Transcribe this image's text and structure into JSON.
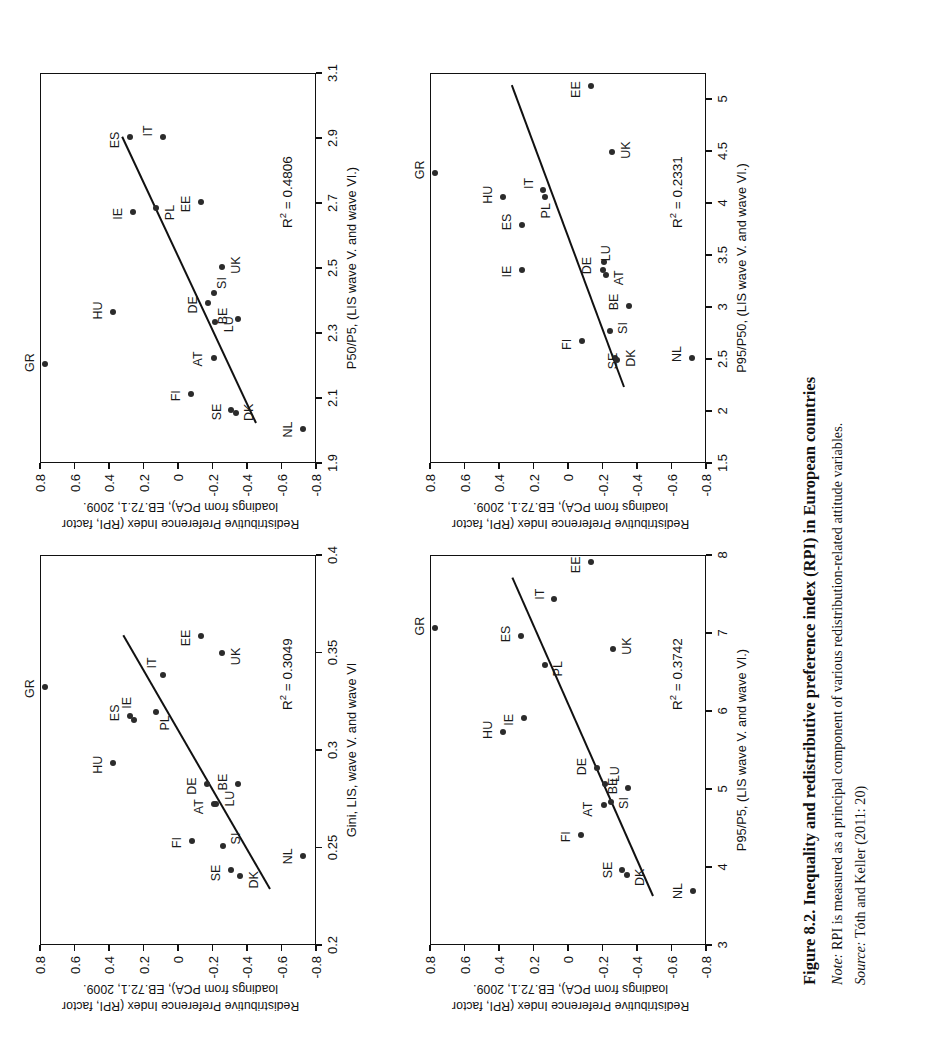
{
  "figure": {
    "number": "Figure 8.2.",
    "title": "Inequality and redistributive preference index (RPI) in European countries",
    "note_label": "Note:",
    "note_text": "RPI is measured as a principal component of various redistribution-related attitude variables.",
    "source_label": "Source:",
    "source_text": "Tóth and Keller (2011: 20)"
  },
  "shared": {
    "ylabel": "Redistributive Preference Index (RPI, factor loadings from PCA),  EB.72.1, 2009.",
    "ylabel_line1": "Redistributive Preference Index (RPI, factor",
    "ylabel_line2": "loadings from PCA),  EB.72.1, 2009.",
    "yticks": [
      "0.8",
      "0.6",
      "0.4",
      "0.2",
      "0",
      "-0.2",
      "-0.4",
      "-0.6",
      "-0.8"
    ],
    "yvalues": [
      0.8,
      0.6,
      0.4,
      0.2,
      0,
      -0.2,
      -0.4,
      -0.6,
      -0.8
    ],
    "ylim": [
      -0.8,
      0.8
    ]
  },
  "chart_data": [
    {
      "id": "gini",
      "type": "scatter",
      "position": "top-left",
      "title": "",
      "xlabel": "Gini, LIS, wave  V. and wave VI",
      "ylabel": "Redistributive Preference Index (RPI, factor loadings from PCA),  EB.72.1, 2009.",
      "r2_label": "R² = 0.3049",
      "r2": 0.3049,
      "xlim": [
        0.2,
        0.4
      ],
      "ylim": [
        -0.8,
        0.8
      ],
      "xticks": [
        "0.2",
        "0.25",
        "0.3",
        "0.35",
        "0.4"
      ],
      "xtickvalues": [
        0.2,
        0.25,
        0.3,
        0.35,
        0.4
      ],
      "grid": false,
      "trendline": {
        "x1": 0.228,
        "y1": -0.52,
        "x2": 0.358,
        "y2": 0.33
      },
      "points": [
        {
          "label": "GR",
          "x": 0.332,
          "y": 0.775,
          "lx": -2,
          "ly": -15
        },
        {
          "label": "HU",
          "x": 0.293,
          "y": 0.385,
          "lx": -2,
          "ly": -15
        },
        {
          "label": "ES",
          "x": 0.317,
          "y": 0.285,
          "lx": 3,
          "ly": -15
        },
        {
          "label": "IE",
          "x": 0.315,
          "y": 0.262,
          "lx": 17,
          "ly": -7
        },
        {
          "label": "PL",
          "x": 0.319,
          "y": 0.135,
          "lx": -11,
          "ly": 9
        },
        {
          "label": "IT",
          "x": 0.338,
          "y": 0.09,
          "lx": 12,
          "ly": -11
        },
        {
          "label": "EE",
          "x": 0.358,
          "y": -0.125,
          "lx": -2,
          "ly": -15
        },
        {
          "label": "UK",
          "x": 0.349,
          "y": -0.25,
          "lx": -3,
          "ly": 14
        },
        {
          "label": "DE",
          "x": 0.282,
          "y": -0.165,
          "lx": -2,
          "ly": -15
        },
        {
          "label": "AT",
          "x": 0.272,
          "y": -0.205,
          "lx": -3,
          "ly": -15
        },
        {
          "label": "LU",
          "x": 0.272,
          "y": -0.215,
          "lx": 5,
          "ly": 14
        },
        {
          "label": "BE",
          "x": 0.282,
          "y": -0.34,
          "lx": 2,
          "ly": -15
        },
        {
          "label": "SI",
          "x": 0.25,
          "y": -0.255,
          "lx": 8,
          "ly": 13
        },
        {
          "label": "FI",
          "x": 0.253,
          "y": -0.075,
          "lx": -2,
          "ly": -15
        },
        {
          "label": "SE",
          "x": 0.238,
          "y": -0.3,
          "lx": -3,
          "ly": -15
        },
        {
          "label": "DK",
          "x": 0.235,
          "y": -0.355,
          "lx": -4,
          "ly": 14
        },
        {
          "label": "NL",
          "x": 0.245,
          "y": -0.72,
          "lx": 0,
          "ly": -15
        }
      ]
    },
    {
      "id": "p50p5",
      "type": "scatter",
      "position": "top-right",
      "title": "",
      "xlabel": "P50/P5, (LIS wave V. and wave VI.)",
      "ylabel": "Redistributive Preference Index (RPI, factor loadings from PCA),  EB.72.1, 2009.",
      "r2_label": "R² = 0.4806",
      "r2": 0.4806,
      "xlim": [
        1.9,
        3.1
      ],
      "ylim": [
        -0.8,
        0.8
      ],
      "xticks": [
        "1.9",
        "2.1",
        "2.3",
        "2.5",
        "2.7",
        "2.9",
        "3.1"
      ],
      "xtickvalues": [
        1.9,
        2.1,
        2.3,
        2.5,
        2.7,
        2.9,
        3.1
      ],
      "grid": false,
      "trendline": {
        "x1": 2.02,
        "y1": -0.44,
        "x2": 2.9,
        "y2": 0.335
      },
      "points": [
        {
          "label": "GR",
          "x": 2.2,
          "y": 0.775,
          "lx": 2,
          "ly": -15
        },
        {
          "label": "HU",
          "x": 2.36,
          "y": 0.38,
          "lx": 2,
          "ly": -15
        },
        {
          "label": "ES",
          "x": 2.9,
          "y": 0.285,
          "lx": -3,
          "ly": -15
        },
        {
          "label": "IE",
          "x": 2.67,
          "y": 0.265,
          "lx": -2,
          "ly": -15
        },
        {
          "label": "PL",
          "x": 2.68,
          "y": 0.135,
          "lx": -4,
          "ly": 14
        },
        {
          "label": "IT",
          "x": 2.9,
          "y": 0.09,
          "lx": 6,
          "ly": -15
        },
        {
          "label": "EE",
          "x": 2.7,
          "y": -0.125,
          "lx": -2,
          "ly": -15
        },
        {
          "label": "UK",
          "x": 2.5,
          "y": -0.25,
          "lx": 2,
          "ly": 14
        },
        {
          "label": "DE",
          "x": 2.39,
          "y": -0.17,
          "lx": -2,
          "ly": -15
        },
        {
          "label": "SI",
          "x": 2.42,
          "y": -0.205,
          "lx": 10,
          "ly": 8
        },
        {
          "label": "AT",
          "x": 2.22,
          "y": -0.205,
          "lx": -1,
          "ly": -16
        },
        {
          "label": "LU",
          "x": 2.33,
          "y": -0.21,
          "lx": -2,
          "ly": 14
        },
        {
          "label": "BE",
          "x": 2.34,
          "y": -0.34,
          "lx": 3,
          "ly": -15
        },
        {
          "label": "FI",
          "x": 2.11,
          "y": -0.07,
          "lx": -2,
          "ly": -15
        },
        {
          "label": "SE",
          "x": 2.06,
          "y": -0.3,
          "lx": -2,
          "ly": -14
        },
        {
          "label": "DK",
          "x": 2.05,
          "y": -0.33,
          "lx": 1,
          "ly": 13
        },
        {
          "label": "NL",
          "x": 2.0,
          "y": -0.72,
          "lx": 0,
          "ly": -15
        }
      ]
    },
    {
      "id": "p95p5",
      "type": "scatter",
      "position": "bottom-left",
      "title": "",
      "xlabel": "P95/P5, (LIS wave V. and wave VI.)",
      "ylabel": "Redistributive Preference Index (RPI, factor loadings from PCA),  EB.72.1, 2009.",
      "r2_label": "R² = 0.3742",
      "r2": 0.3742,
      "xlim": [
        3,
        8
      ],
      "ylim": [
        -0.8,
        0.8
      ],
      "xticks": [
        "3",
        "4",
        "5",
        "6",
        "7",
        "8"
      ],
      "xtickvalues": [
        3,
        4,
        5,
        6,
        7,
        8
      ],
      "grid": false,
      "trendline": {
        "x1": 3.62,
        "y1": -0.48,
        "x2": 7.7,
        "y2": 0.335
      },
      "points": [
        {
          "label": "GR",
          "x": 7.05,
          "y": 0.775,
          "lx": 2,
          "ly": -15
        },
        {
          "label": "HU",
          "x": 5.72,
          "y": 0.385,
          "lx": 2,
          "ly": -15
        },
        {
          "label": "ES",
          "x": 6.95,
          "y": 0.28,
          "lx": 2,
          "ly": -15
        },
        {
          "label": "IE",
          "x": 5.9,
          "y": 0.26,
          "lx": -2,
          "ly": -15
        },
        {
          "label": "PL",
          "x": 6.58,
          "y": 0.14,
          "lx": -4,
          "ly": 13
        },
        {
          "label": "IT",
          "x": 7.42,
          "y": 0.085,
          "lx": 5,
          "ly": -14
        },
        {
          "label": "EE",
          "x": 7.9,
          "y": -0.13,
          "lx": -3,
          "ly": -15
        },
        {
          "label": "UK",
          "x": 6.78,
          "y": -0.255,
          "lx": 3,
          "ly": 14
        },
        {
          "label": "DE",
          "x": 5.25,
          "y": -0.165,
          "lx": 2,
          "ly": -15
        },
        {
          "label": "LU",
          "x": 5.05,
          "y": -0.21,
          "lx": 10,
          "ly": 10
        },
        {
          "label": "SI",
          "x": 4.82,
          "y": -0.245,
          "lx": -1,
          "ly": 13
        },
        {
          "label": "AT",
          "x": 4.78,
          "y": -0.205,
          "lx": -4,
          "ly": -16
        },
        {
          "label": "BE",
          "x": 5.0,
          "y": -0.34,
          "lx": 2,
          "ly": -15
        },
        {
          "label": "FI",
          "x": 4.4,
          "y": -0.07,
          "lx": -2,
          "ly": -15
        },
        {
          "label": "SE",
          "x": 3.95,
          "y": -0.305,
          "lx": 0,
          "ly": -14
        },
        {
          "label": "DK",
          "x": 3.88,
          "y": -0.335,
          "lx": -2,
          "ly": 13
        },
        {
          "label": "NL",
          "x": 3.68,
          "y": -0.72,
          "lx": 0,
          "ly": -15
        }
      ]
    },
    {
      "id": "p95p50",
      "type": "scatter",
      "position": "bottom-right",
      "title": "",
      "xlabel": "P95/P50, (LIS wave V. and wave VI.)",
      "ylabel": "Redistributive Preference Index (RPI, factor loadings from PCA),  EB.72.1, 2009.",
      "r2_label": "R² = 0.2331",
      "r2": 0.2331,
      "xlim": [
        1.5,
        5.25
      ],
      "ylim": [
        -0.8,
        0.8
      ],
      "xticks": [
        "1.5",
        "2",
        "2.5",
        "3",
        "3.5",
        "4",
        "4.5",
        "5"
      ],
      "xtickvalues": [
        1.5,
        2,
        2.5,
        3,
        3.5,
        4,
        4.5,
        5
      ],
      "grid": false,
      "trendline": {
        "x1": 2.22,
        "y1": -0.315,
        "x2": 5.12,
        "y2": 0.335
      },
      "points": [
        {
          "label": "GR",
          "x": 4.28,
          "y": 0.775,
          "lx": 3,
          "ly": -15
        },
        {
          "label": "HU",
          "x": 4.05,
          "y": 0.385,
          "lx": 2,
          "ly": -15
        },
        {
          "label": "ES",
          "x": 3.78,
          "y": 0.27,
          "lx": 3,
          "ly": -15
        },
        {
          "label": "IE",
          "x": 3.35,
          "y": 0.27,
          "lx": -2,
          "ly": -15
        },
        {
          "label": "PL",
          "x": 4.05,
          "y": 0.14,
          "lx": -14,
          "ly": 1
        },
        {
          "label": "IT",
          "x": 4.12,
          "y": 0.15,
          "lx": 6,
          "ly": -14
        },
        {
          "label": "EE",
          "x": 5.12,
          "y": -0.13,
          "lx": -4,
          "ly": -15
        },
        {
          "label": "UK",
          "x": 4.48,
          "y": -0.25,
          "lx": 2,
          "ly": 14
        },
        {
          "label": "DE",
          "x": 3.35,
          "y": -0.195,
          "lx": 4,
          "ly": -16
        },
        {
          "label": "LU",
          "x": 3.42,
          "y": -0.2,
          "lx": 9,
          "ly": 2
        },
        {
          "label": "AT",
          "x": 3.3,
          "y": -0.215,
          "lx": -3,
          "ly": 13
        },
        {
          "label": "BE",
          "x": 3.0,
          "y": -0.345,
          "lx": 4,
          "ly": -15
        },
        {
          "label": "SI",
          "x": 2.76,
          "y": -0.235,
          "lx": 3,
          "ly": 13
        },
        {
          "label": "SE",
          "x": 2.5,
          "y": -0.265,
          "lx": -3,
          "ly": -2
        },
        {
          "label": "DK",
          "x": 2.48,
          "y": -0.28,
          "lx": 2,
          "ly": 14
        },
        {
          "label": "FI",
          "x": 2.66,
          "y": -0.075,
          "lx": -3,
          "ly": -15
        },
        {
          "label": "NL",
          "x": 2.5,
          "y": -0.715,
          "lx": 4,
          "ly": -15
        }
      ]
    }
  ]
}
